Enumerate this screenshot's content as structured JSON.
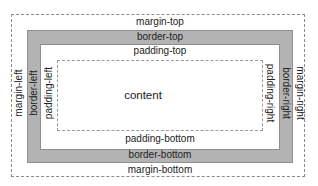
{
  "diagram": {
    "colors": {
      "border_fill": "#b3b3b3",
      "dashed_line": "#8a8a8a",
      "background": "#ffffff",
      "text": "#222222"
    },
    "labels": {
      "margin_top": "margin-top",
      "border_top": "border-top",
      "padding_top": "padding-top",
      "content": "content",
      "padding_bottom": "padding-bottom",
      "border_bottom": "border-bottom",
      "margin_bottom": "margin-bottom",
      "margin_left": "margin-left",
      "border_left": "border-left",
      "padding_left": "padding-left",
      "padding_right": "padding-right",
      "border_right": "border-right",
      "margin_right": "margin-right"
    }
  }
}
